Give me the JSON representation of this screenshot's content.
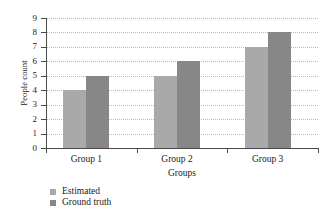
{
  "chart_data": {
    "type": "bar",
    "title": "",
    "xlabel": "Groups",
    "ylabel": "People count",
    "categories": [
      "Group 1",
      "Group 2",
      "Group 3"
    ],
    "series": [
      {
        "name": "Estimated",
        "values": [
          4,
          5,
          7
        ],
        "color": "#a9a9a9"
      },
      {
        "name": "Ground truth",
        "values": [
          5,
          6,
          8
        ],
        "color": "#878787"
      }
    ],
    "ylim": [
      0,
      9
    ],
    "ytick_labels": [
      "0",
      "1",
      "2",
      "3",
      "4",
      "5",
      "6",
      "7",
      "8",
      "9"
    ],
    "ytick_values": [
      0,
      1,
      2,
      3,
      4,
      5,
      6,
      7,
      8,
      9
    ],
    "grid": "horizontal-dotted",
    "legend_position": "below-left"
  }
}
